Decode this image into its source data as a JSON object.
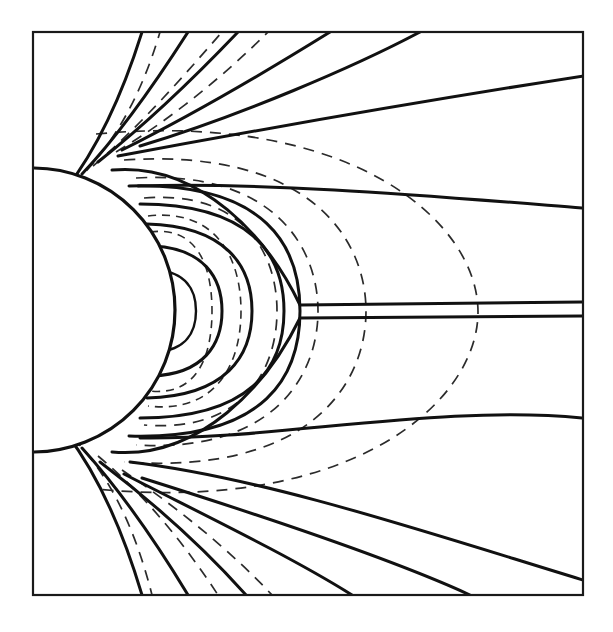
{
  "figure": {
    "kind": "magnetic-field-line-diagram",
    "title": "",
    "caption": "",
    "background_color": "#ffffff",
    "frame": {
      "stroke_color": "#1a1a1a",
      "x": 33,
      "y": 32,
      "width": 550,
      "height": 563
    },
    "legend_note": "solid = distorted (compressed) field lines; dashed = undisturbed dipole field lines",
    "line_styles": {
      "solid_label": "distorted field line",
      "solid_color": "#111111",
      "dashed_label": "dipole field line",
      "dashed_color": "#2b2b2b"
    }
  },
  "chart_data": {
    "type": "line",
    "title": "",
    "xlabel": "",
    "ylabel": "",
    "grid": false,
    "legend_position": "none",
    "xlim": [
      33,
      583
    ],
    "ylim": [
      32,
      595
    ],
    "body": {
      "name": "planet",
      "center_x": 33,
      "center_y": 310,
      "radius": 142,
      "fill": "#ffffff",
      "stroke": "#111111"
    },
    "neutral_point": {
      "x": 300,
      "y": 312
    },
    "series": [
      {
        "name": "dipole-loop-1",
        "style": "dashed",
        "path": "M 150 232 C 196 226 212 264 212 311 C 212 358 196 396 150 391"
      },
      {
        "name": "dipole-loop-2",
        "style": "dashed",
        "path": "M 148 216 C 216 208 241 258 241 311 C 241 364 216 414 148 406"
      },
      {
        "name": "dipole-loop-3",
        "style": "dashed",
        "path": "M 144 198 C 242 190 277 252 277 311 C 277 371 242 433 144 425"
      },
      {
        "name": "dipole-loop-4",
        "style": "dashed",
        "path": "M 136 178 C 272 170 318 246 318 311 C 318 377 272 453 136 445"
      },
      {
        "name": "dipole-loop-5",
        "style": "dashed",
        "path": "M 124 160 C 306 148 366 236 366 311 C 366 387 306 475 124 462"
      },
      {
        "name": "dipole-loop-6-outer",
        "style": "dashed",
        "path": "M 96 134 C 352 110 478 222 478 312 C 478 402 352 514 96 489"
      },
      {
        "name": "dipole-open-up-1",
        "style": "dashed",
        "path": "M 73 184 C 110 150 140 100 160 32"
      },
      {
        "name": "dipole-open-up-2",
        "style": "dashed",
        "path": "M 93 166 C 140 126 182 78 222 32"
      },
      {
        "name": "dipole-open-up-3",
        "style": "dashed",
        "path": "M 116 152 C 170 120 226 74 268 32"
      },
      {
        "name": "dipole-open-down-1",
        "style": "dashed",
        "path": "M 73 438 C 108 474 134 524 152 595"
      },
      {
        "name": "dipole-open-down-2",
        "style": "dashed",
        "path": "M 98 456 C 146 496 186 546 218 595"
      },
      {
        "name": "dipole-open-down-3",
        "style": "dashed",
        "path": "M 122 470 C 178 508 232 552 272 595"
      },
      {
        "name": "closed-fl-1",
        "style": "solid",
        "path": "M 156 270 C 186 272 196 290 196 311 C 196 332 186 350 156 352"
      },
      {
        "name": "closed-fl-2",
        "style": "solid",
        "path": "M 152 246 C 204 248 222 278 222 311 C 222 344 204 374 152 376"
      },
      {
        "name": "closed-fl-3",
        "style": "solid",
        "path": "M 147 224 C 226 226 252 266 252 311 C 252 356 226 396 147 398"
      },
      {
        "name": "closed-fl-4",
        "style": "solid",
        "path": "M 140 204 C 250 204 284 254 284 311 C 284 368 250 418 140 418"
      },
      {
        "name": "closed-fl-5",
        "style": "solid",
        "path": "M 129 186 C 268 182 300 248 300 311 C 300 374 268 440 129 436"
      },
      {
        "name": "tail-separatrix-upper",
        "style": "solid",
        "path": "M 112 170 C 200 162 268 238 300 305 L 583 302"
      },
      {
        "name": "tail-separatrix-lower",
        "style": "solid",
        "path": "M 112 452 C 200 460 268 384 300 318 L 583 316"
      },
      {
        "name": "open-fl-north-1",
        "style": "solid",
        "path": "M 66 189 C 96 150 122 96 142 32"
      },
      {
        "name": "open-fl-north-2",
        "style": "solid",
        "path": "M 82 174 C 120 134 156 82 188 32"
      },
      {
        "name": "open-fl-north-3",
        "style": "solid",
        "path": "M 98 162 C 146 124 198 74 238 32"
      },
      {
        "name": "open-fl-north-4",
        "style": "solid",
        "path": "M 122 150 C 190 116 272 68 330 32"
      },
      {
        "name": "open-fl-north-5",
        "style": "solid",
        "path": "M 140 146 C 240 116 356 66 420 32"
      },
      {
        "name": "open-fl-north-6",
        "style": "solid",
        "path": "M 118 156 C 236 134 390 106 583 76"
      },
      {
        "name": "open-fl-north-7",
        "style": "solid",
        "path": "M 138 186 C 268 182 430 196 583 208"
      },
      {
        "name": "open-fl-south-1",
        "style": "solid",
        "path": "M 66 433 C 96 472 122 528 142 595"
      },
      {
        "name": "open-fl-south-2",
        "style": "solid",
        "path": "M 82 448 C 120 490 156 542 188 595"
      },
      {
        "name": "open-fl-south-3",
        "style": "solid",
        "path": "M 100 462 C 150 500 204 548 246 595"
      },
      {
        "name": "open-fl-south-4",
        "style": "solid",
        "path": "M 124 474 C 198 512 290 556 352 595"
      },
      {
        "name": "open-fl-south-5",
        "style": "solid",
        "path": "M 142 478 C 250 512 390 558 470 595"
      },
      {
        "name": "open-fl-south-6",
        "style": "solid",
        "path": "M 130 462 C 266 478 432 534 583 580"
      },
      {
        "name": "open-fl-south-7",
        "style": "solid",
        "path": "M 140 438 C 274 440 440 404 583 418"
      }
    ]
  }
}
